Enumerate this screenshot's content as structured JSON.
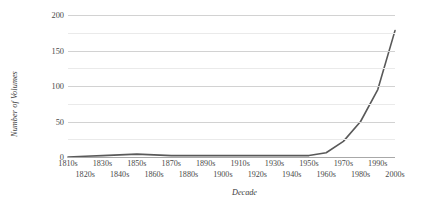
{
  "chart_data": {
    "type": "line",
    "title": "",
    "xlabel": "Decade",
    "ylabel": "Number of Volumes",
    "categories": [
      "1810s",
      "1820s",
      "1830s",
      "1840s",
      "1850s",
      "1860s",
      "1870s",
      "1880s",
      "1890s",
      "1900s",
      "1910s",
      "1920s",
      "1930s",
      "1940s",
      "1950s",
      "1960s",
      "1970s",
      "1980s",
      "1990s",
      "2000s"
    ],
    "values": [
      0,
      1,
      2,
      3,
      4,
      3,
      2,
      2,
      2,
      2,
      2,
      2,
      2,
      2,
      2,
      6,
      22,
      50,
      95,
      178
    ],
    "ylim": [
      0,
      200
    ],
    "yticks": [
      0,
      50,
      100,
      150,
      200
    ],
    "ytick_labels": [
      "0",
      "50",
      "100",
      "150",
      "200"
    ],
    "minor_yticks": [
      25,
      75,
      125,
      175
    ],
    "grid": true,
    "legend": false,
    "series_color": "#595959",
    "gridline_color": "#dcdcdc",
    "axis_color": "#a8a8a8",
    "background": "#ffffff"
  }
}
